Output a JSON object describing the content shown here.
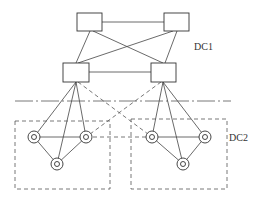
{
  "diagram": {
    "labels": {
      "dc1": "DC1",
      "dc2": "DC2"
    },
    "colors": {
      "stroke": "#444444",
      "background": "#ffffff"
    },
    "dc1": {
      "switches": [
        {
          "id": "top-left",
          "x": 77,
          "y": 13,
          "w": 25,
          "h": 18
        },
        {
          "id": "top-right",
          "x": 164,
          "y": 13,
          "w": 25,
          "h": 18
        },
        {
          "id": "mid-left",
          "x": 63,
          "y": 63,
          "w": 26,
          "h": 19
        },
        {
          "id": "mid-right",
          "x": 151,
          "y": 63,
          "w": 25,
          "h": 19
        }
      ]
    },
    "dc2": {
      "groups": [
        {
          "id": "left-group",
          "x": 15,
          "y": 121,
          "w": 95,
          "h": 68
        },
        {
          "id": "right-group",
          "x": 131,
          "y": 119,
          "w": 96,
          "h": 70
        }
      ],
      "nodes": [
        {
          "id": "L1",
          "cx": 34,
          "cy": 137
        },
        {
          "id": "L2",
          "cx": 86,
          "cy": 137
        },
        {
          "id": "L3",
          "cx": 57,
          "cy": 164
        },
        {
          "id": "R1",
          "cx": 152,
          "cy": 137
        },
        {
          "id": "R2",
          "cx": 205,
          "cy": 137
        },
        {
          "id": "R3",
          "cx": 183,
          "cy": 164
        }
      ]
    },
    "separator": {
      "x1": 15,
      "x2": 231,
      "y": 101
    }
  }
}
